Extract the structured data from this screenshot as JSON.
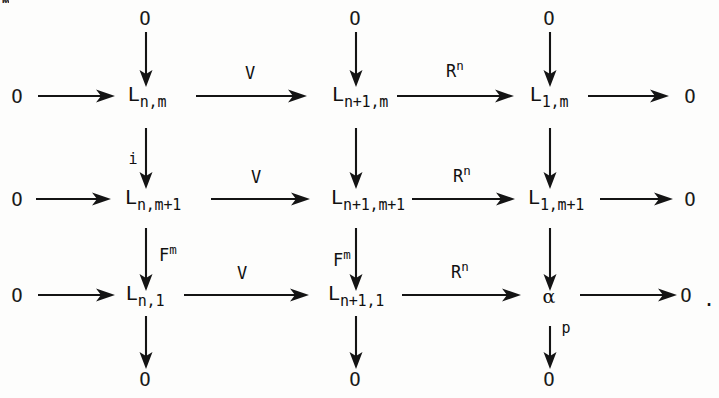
{
  "figure": {
    "kind": "commutative-diagram",
    "stray_mark": "m",
    "trailing_period": "."
  },
  "symbols": {
    "zero": "O",
    "alpha": "α",
    "L": "L"
  },
  "objects": {
    "r1c1": {
      "base": "L",
      "sub": "n,m"
    },
    "r1c2": {
      "base": "L",
      "sub": "n+1,m"
    },
    "r1c3": {
      "base": "L",
      "sub": "1,m"
    },
    "r2c1": {
      "base": "L",
      "sub": "n,m+1"
    },
    "r2c2": {
      "base": "L",
      "sub": "n+1,m+1"
    },
    "r2c3": {
      "base": "L",
      "sub": "1,m+1"
    },
    "r3c1": {
      "base": "L",
      "sub": "n,1"
    },
    "r3c2": {
      "base": "L",
      "sub": "n+1,1"
    },
    "r3c3": {
      "base": "α",
      "sub": ""
    }
  },
  "zeros": {
    "left_row1": "O",
    "left_row2": "O",
    "left_row3": "O",
    "right_row1": "O",
    "right_row2": "O",
    "right_row3": "O",
    "top_col1": "O",
    "top_col2": "O",
    "top_col3": "O",
    "bottom_col1": "O",
    "bottom_col2": "O",
    "bottom_col3": "O"
  },
  "arrow_labels": {
    "h_r1_c1c2": {
      "base": "V",
      "sup": ""
    },
    "h_r1_c2c3": {
      "base": "R",
      "sup": "n"
    },
    "h_r2_c1c2": {
      "base": "V",
      "sup": ""
    },
    "h_r2_c2c3": {
      "base": "R",
      "sup": "n"
    },
    "h_r3_c1c2": {
      "base": "V",
      "sup": ""
    },
    "h_r3_c2c3": {
      "base": "R",
      "sup": "n"
    },
    "v_c1_r1r2": {
      "base": "i",
      "sup": ""
    },
    "v_c1_r2r3": {
      "base": "F",
      "sup": "m"
    },
    "v_c2_r2r3": {
      "base": "F",
      "sup": "m"
    },
    "v_c3_r3bottom": {
      "base": "p",
      "sup": ""
    }
  },
  "rows": [
    {
      "id": "row-1",
      "sequence": "O → L_{n,m} →^{V} L_{n+1,m} →^{R^n} L_{1,m} → O"
    },
    {
      "id": "row-2",
      "sequence": "O → L_{n,m+1} →^{V} L_{n+1,m+1} →^{R^n} L_{1,m+1} → O"
    },
    {
      "id": "row-3",
      "sequence": "O → L_{n,1} →^{V} L_{n+1,1} →^{R^n} α → O ."
    }
  ],
  "columns": [
    {
      "id": "col-1",
      "sequence": "O → L_{n,m} →^{i} L_{n,m+1} →^{F^m} L_{n,1} → O"
    },
    {
      "id": "col-2",
      "sequence": "O → L_{n+1,m} → L_{n+1,m+1} →^{F^m} L_{n+1,1} → O"
    },
    {
      "id": "col-3",
      "sequence": "O → L_{1,m} → L_{1,m+1} → α →^{p} O"
    }
  ]
}
